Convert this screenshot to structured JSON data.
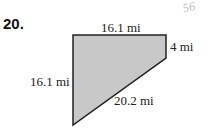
{
  "problem_number": "20.",
  "handwritten_note": "56",
  "figure": {
    "shape": "quadrilateral",
    "fill_color": "#c8c8c8",
    "edge_color": "#222222",
    "labels": {
      "top": "16.1 mi",
      "right": "4 mi",
      "left": "16.1 mi",
      "diagonal": "20.2 mi"
    }
  }
}
